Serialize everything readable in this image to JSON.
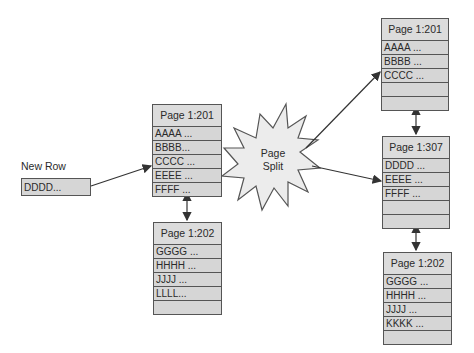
{
  "diagram": {
    "new_row": {
      "label": "New Row",
      "value": "DDDD..."
    },
    "split_label": {
      "line1": "Page",
      "line2": "Split"
    },
    "before": {
      "page_201": {
        "title": "Page 1:201",
        "rows": [
          "AAAA ...",
          "BBBB...",
          "CCCC ...",
          "EEEE ...",
          "FFFF ..."
        ]
      },
      "page_202": {
        "title": "Page 1:202",
        "rows": [
          "GGGG ...",
          "HHHH ...",
          "JJJJ ...",
          "LLLL...",
          ""
        ]
      }
    },
    "after": {
      "page_201": {
        "title": "Page 1:201",
        "rows": [
          "AAAA ...",
          "BBBB ...",
          "CCCC ...",
          "",
          ""
        ]
      },
      "page_307": {
        "title": "Page 1:307",
        "rows": [
          "DDDD ...",
          "EEEE ...",
          "FFFF ...",
          "",
          ""
        ]
      },
      "page_202": {
        "title": "Page 1:202",
        "rows": [
          "GGGG ...",
          "HHHH ...",
          "JJJJ ...",
          "KKKK ...",
          ""
        ]
      }
    },
    "colors": {
      "box_fill": "#d6d6d6",
      "border": "#555555",
      "burst_fill": "#ececec",
      "arrow": "#333333"
    }
  }
}
